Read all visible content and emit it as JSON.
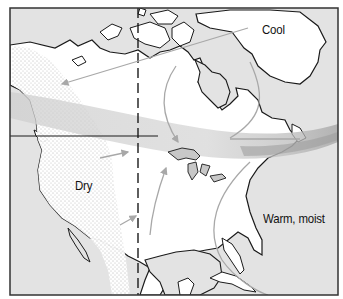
{
  "map": {
    "subject": "North America air masses",
    "labels": {
      "cool": "Cool",
      "dry": "Dry",
      "warm_moist": "Warm, moist"
    },
    "colors": {
      "ocean": "#e3e3e3",
      "land": "#ffffff",
      "coastline": "#1a1a1a",
      "front_band": "#c8c8c8",
      "front_band_dark": "#a9a9a9",
      "arrow": "#a8a8a8",
      "dry_stipple": "#6a6a6a",
      "frame": "#333333"
    },
    "features": {
      "meridian_line": "dashed vertical line",
      "border_line": "Canada–US border",
      "dry_region": "stippled western interior",
      "front": "gray band from Pacific northwest to Atlantic"
    }
  }
}
